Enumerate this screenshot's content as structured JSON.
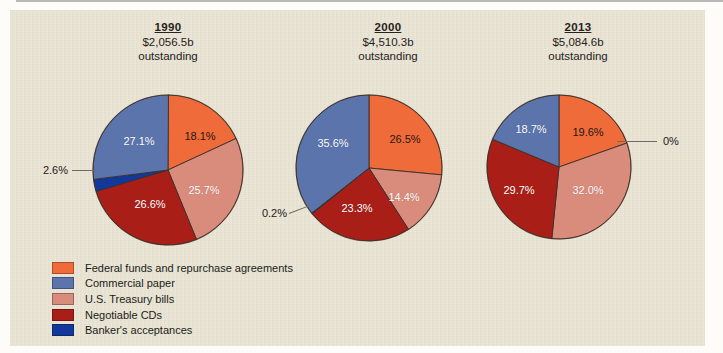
{
  "figure": {
    "background_color": "#e9e4d3",
    "legend": {
      "items": [
        {
          "label": "Federal funds and repurchase agreements",
          "color": "#f06b3a"
        },
        {
          "label": "Commercial paper",
          "color": "#5b74ac"
        },
        {
          "label": "U.S. Treasury bills",
          "color": "#d98b7c"
        },
        {
          "label": "Negotiable CDs",
          "color": "#a91f18"
        },
        {
          "label": "Banker's acceptances",
          "color": "#11389a"
        }
      ]
    }
  },
  "chart_data": {
    "type": "pie",
    "title": "",
    "legend_position": "bottom-left",
    "categories": [
      "Federal funds and repurchase agreements",
      "Commercial paper",
      "U.S. Treasury bills",
      "Negotiable CDs",
      "Banker's acceptances"
    ],
    "colors": [
      "#f06b3a",
      "#5b74ac",
      "#d98b7c",
      "#a91f18",
      "#11389a"
    ],
    "panels": [
      {
        "year": "1990",
        "amount": "$2,056.5b",
        "amount_note": "outstanding",
        "values": [
          18.1,
          27.1,
          25.7,
          26.6,
          2.6
        ],
        "labels": [
          "18.1%",
          "27.1%",
          "25.7%",
          "26.6%",
          "2.6%"
        ],
        "callouts": [
          {
            "label": "2.6%",
            "series": "Banker's acceptances"
          }
        ]
      },
      {
        "year": "2000",
        "amount": "$4,510.3b",
        "amount_note": "outstanding",
        "values": [
          26.5,
          35.6,
          14.4,
          23.3,
          0.2
        ],
        "labels": [
          "26.5%",
          "35.6%",
          "14.4%",
          "23.3%",
          "0.2%"
        ],
        "callouts": [
          {
            "label": "0.2%",
            "series": "Banker's acceptances"
          }
        ]
      },
      {
        "year": "2013",
        "amount": "$5,084.6b",
        "amount_note": "outstanding",
        "values": [
          19.6,
          18.7,
          32.0,
          29.7,
          0.0
        ],
        "labels": [
          "19.6%",
          "18.7%",
          "32.0%",
          "29.7%",
          "0%"
        ],
        "callouts": [
          {
            "label": "0%",
            "series": "Banker's acceptances"
          }
        ]
      }
    ]
  }
}
